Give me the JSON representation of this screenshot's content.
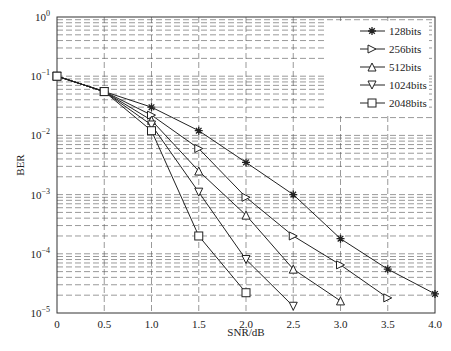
{
  "chart_data": {
    "type": "line",
    "title": "",
    "xlabel": "SNR/dB",
    "ylabel": "BER",
    "yscale": "log",
    "xlim": [
      0,
      4.0
    ],
    "ylim": [
      1e-05,
      1
    ],
    "grid": true,
    "legend_position": "upper right",
    "x_ticks": [
      "0",
      "0.5",
      "1.0",
      "1.5",
      "2.0",
      "2.5",
      "3.0",
      "3.5",
      "4.0"
    ],
    "y_ticks": [
      "10^0",
      "10^-1",
      "10^-2",
      "10^-3",
      "10^-4",
      "10^-5"
    ],
    "series": [
      {
        "name": "128bits",
        "marker": "star",
        "x": [
          0,
          0.5,
          1.0,
          1.5,
          2.0,
          2.5,
          3.0,
          3.5,
          4.0
        ],
        "values": [
          0.1,
          0.055,
          0.03,
          0.012,
          0.0035,
          0.001,
          0.00018,
          5.5e-05,
          2.1e-05
        ]
      },
      {
        "name": "256bits",
        "marker": "triangle-right",
        "x": [
          0,
          0.5,
          1.0,
          1.5,
          2.0,
          2.5,
          3.0,
          3.5
        ],
        "values": [
          0.1,
          0.055,
          0.022,
          0.006,
          0.0009,
          0.0002,
          6.5e-05,
          1.8e-05
        ]
      },
      {
        "name": "512bits",
        "marker": "triangle-up",
        "x": [
          0,
          0.5,
          1.0,
          1.5,
          2.0,
          2.5,
          3.0
        ],
        "values": [
          0.1,
          0.055,
          0.018,
          0.0025,
          0.00045,
          5.5e-05,
          1.6e-05
        ]
      },
      {
        "name": "1024bits",
        "marker": "triangle-down",
        "x": [
          0,
          0.5,
          1.0,
          1.5,
          2.0,
          2.5
        ],
        "values": [
          0.1,
          0.055,
          0.015,
          0.0011,
          8e-05,
          1.3e-05
        ]
      },
      {
        "name": "2048bits",
        "marker": "square",
        "x": [
          0,
          0.5,
          1.0,
          1.5,
          2.0
        ],
        "values": [
          0.1,
          0.055,
          0.012,
          0.0002,
          2.2e-05
        ]
      }
    ]
  },
  "axes": {
    "xlabel": "SNR/dB",
    "ylabel": "BER"
  }
}
